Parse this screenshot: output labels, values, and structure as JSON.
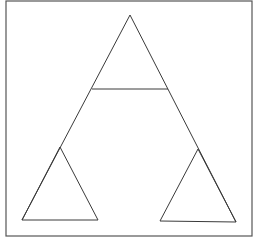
{
  "diagram": {
    "frame": {
      "x": 6,
      "y": 1,
      "width": 246,
      "height": 235,
      "stroke": "#555555",
      "stroke_width": 1.2
    },
    "line_color": "#3a3a3a",
    "line_width": 1,
    "shapes": [
      {
        "name": "large-triangle-left-edge",
        "points": [
          [
            130,
            15
          ],
          [
            22,
            220
          ]
        ]
      },
      {
        "name": "large-triangle-right-edge",
        "points": [
          [
            130,
            15
          ],
          [
            236,
            222
          ]
        ]
      },
      {
        "name": "top-triangle-base",
        "points": [
          [
            92,
            89
          ],
          [
            168,
            89
          ]
        ]
      },
      {
        "name": "left-small-triangle",
        "points": [
          [
            60,
            147
          ],
          [
            22,
            220
          ],
          [
            98,
            220
          ]
        ]
      },
      {
        "name": "right-small-triangle",
        "points": [
          [
            198,
            149
          ],
          [
            160,
            221
          ],
          [
            236,
            222
          ]
        ]
      }
    ]
  }
}
